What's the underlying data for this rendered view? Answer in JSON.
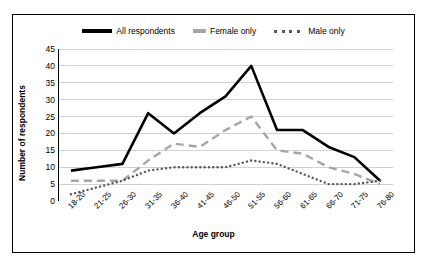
{
  "legend": {
    "items": [
      {
        "label": "All respondents",
        "style": "solid",
        "color": "#000000",
        "icon": "solid-line-swatch"
      },
      {
        "label": "Female only",
        "style": "dashed",
        "color": "#a6a6a6",
        "icon": "dashed-line-swatch"
      },
      {
        "label": "Male only",
        "style": "dotted",
        "color": "#595959",
        "icon": "dotted-line-swatch"
      }
    ]
  },
  "chart_data": {
    "type": "line",
    "title": "",
    "xlabel": "Age group",
    "ylabel": "Number of respondents",
    "ylim": [
      0,
      45
    ],
    "ytick_step": 5,
    "yticks": [
      0,
      5,
      10,
      15,
      20,
      25,
      30,
      35,
      40,
      45
    ],
    "grid": true,
    "legend_position": "top",
    "categories": [
      "18-20",
      "21-25",
      "26-30",
      "31-35",
      "36-40",
      "41-45",
      "46-50",
      "51-55",
      "56-60",
      "61-65",
      "66-70",
      "71-75",
      "76-80"
    ],
    "series": [
      {
        "name": "All respondents",
        "style": "solid",
        "color": "#000000",
        "values": [
          9,
          10,
          11,
          26,
          20,
          26,
          31,
          40,
          21,
          21,
          16,
          13,
          6
        ]
      },
      {
        "name": "Female only",
        "style": "dashed",
        "color": "#a6a6a6",
        "values": [
          6,
          6,
          6,
          12,
          17,
          16,
          21,
          25,
          15,
          14,
          10,
          8,
          5
        ]
      },
      {
        "name": "Male only",
        "style": "dotted",
        "color": "#595959",
        "values": [
          2,
          4,
          6,
          9,
          10,
          10,
          10,
          12,
          11,
          8,
          5,
          5,
          6
        ]
      }
    ]
  }
}
